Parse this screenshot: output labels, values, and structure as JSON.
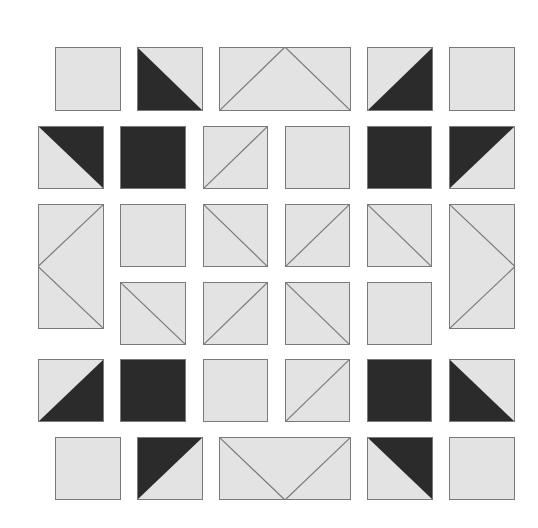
{
  "colors": {
    "light": "#e3e3e3",
    "dark": "#2b2b2b",
    "line": "#7a7a7a",
    "background": "#ffffff"
  },
  "tiles": [
    {
      "id": "r1c1",
      "x": 55,
      "y": 47,
      "w": 66,
      "h": 64,
      "type": "plain"
    },
    {
      "id": "r1c2",
      "x": 137,
      "y": 47,
      "w": 66,
      "h": 64,
      "type": "half-dark-bl"
    },
    {
      "id": "r1c3",
      "x": 219,
      "y": 47,
      "w": 132,
      "h": 64,
      "type": "peak-up"
    },
    {
      "id": "r1c4",
      "x": 367,
      "y": 47,
      "w": 66,
      "h": 64,
      "type": "half-dark-br"
    },
    {
      "id": "r1c5",
      "x": 449,
      "y": 47,
      "w": 66,
      "h": 64,
      "type": "plain"
    },
    {
      "id": "r2c1",
      "x": 38,
      "y": 126,
      "w": 66,
      "h": 63,
      "type": "half-dark-tr"
    },
    {
      "id": "r2c2",
      "x": 120,
      "y": 126,
      "w": 66,
      "h": 63,
      "type": "solid-dark"
    },
    {
      "id": "r2c3",
      "x": 203,
      "y": 126,
      "w": 65,
      "h": 63,
      "type": "line-bl-tr"
    },
    {
      "id": "r2c4",
      "x": 285,
      "y": 126,
      "w": 65,
      "h": 63,
      "type": "plain"
    },
    {
      "id": "r2c5",
      "x": 367,
      "y": 126,
      "w": 65,
      "h": 63,
      "type": "solid-dark"
    },
    {
      "id": "r2c6",
      "x": 449,
      "y": 126,
      "w": 66,
      "h": 63,
      "type": "half-dark-tl"
    },
    {
      "id": "r3c1",
      "x": 38,
      "y": 204,
      "w": 66,
      "h": 125,
      "type": "peak-left"
    },
    {
      "id": "r3c2",
      "x": 120,
      "y": 204,
      "w": 66,
      "h": 63,
      "type": "plain"
    },
    {
      "id": "r3c3",
      "x": 203,
      "y": 204,
      "w": 65,
      "h": 63,
      "type": "line-tl-br"
    },
    {
      "id": "r3c4",
      "x": 285,
      "y": 204,
      "w": 65,
      "h": 63,
      "type": "line-bl-tr"
    },
    {
      "id": "r3c5",
      "x": 367,
      "y": 204,
      "w": 65,
      "h": 63,
      "type": "line-tl-br"
    },
    {
      "id": "r3c6",
      "x": 449,
      "y": 204,
      "w": 66,
      "h": 125,
      "type": "peak-right"
    },
    {
      "id": "r4c2",
      "x": 120,
      "y": 282,
      "w": 66,
      "h": 63,
      "type": "line-tl-br"
    },
    {
      "id": "r4c3",
      "x": 203,
      "y": 282,
      "w": 65,
      "h": 63,
      "type": "line-bl-tr"
    },
    {
      "id": "r4c4",
      "x": 285,
      "y": 282,
      "w": 65,
      "h": 63,
      "type": "line-tl-br"
    },
    {
      "id": "r4c5",
      "x": 367,
      "y": 282,
      "w": 65,
      "h": 63,
      "type": "plain"
    },
    {
      "id": "r5c1",
      "x": 38,
      "y": 359,
      "w": 66,
      "h": 63,
      "type": "half-dark-br"
    },
    {
      "id": "r5c2",
      "x": 120,
      "y": 359,
      "w": 66,
      "h": 63,
      "type": "solid-dark"
    },
    {
      "id": "r5c3",
      "x": 203,
      "y": 359,
      "w": 65,
      "h": 63,
      "type": "plain"
    },
    {
      "id": "r5c4",
      "x": 285,
      "y": 359,
      "w": 65,
      "h": 63,
      "type": "line-bl-tr"
    },
    {
      "id": "r5c5",
      "x": 367,
      "y": 359,
      "w": 65,
      "h": 63,
      "type": "solid-dark"
    },
    {
      "id": "r5c6",
      "x": 449,
      "y": 359,
      "w": 66,
      "h": 63,
      "type": "half-dark-bl"
    },
    {
      "id": "r6c1",
      "x": 55,
      "y": 437,
      "w": 66,
      "h": 63,
      "type": "plain"
    },
    {
      "id": "r6c2",
      "x": 137,
      "y": 437,
      "w": 66,
      "h": 63,
      "type": "half-dark-tl"
    },
    {
      "id": "r6c3",
      "x": 219,
      "y": 437,
      "w": 132,
      "h": 63,
      "type": "peak-down"
    },
    {
      "id": "r6c4",
      "x": 367,
      "y": 437,
      "w": 66,
      "h": 63,
      "type": "half-dark-tr"
    },
    {
      "id": "r6c5",
      "x": 449,
      "y": 437,
      "w": 66,
      "h": 63,
      "type": "plain"
    }
  ]
}
